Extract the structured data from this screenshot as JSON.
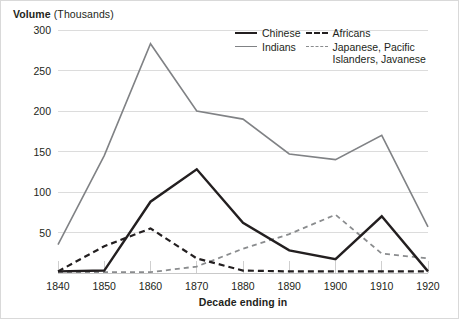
{
  "axis_title": {
    "strong": "Volume",
    "unit": " (Thousands)"
  },
  "xaxis_label": "Decade ending in",
  "legend": {
    "entries": [
      {
        "name": "chinese",
        "label": "Chinese",
        "color": "#231f20",
        "style": "solid",
        "width": 2.4
      },
      {
        "name": "africans",
        "label": "Africans",
        "color": "#231f20",
        "style": "dashed",
        "width": 2.2
      },
      {
        "name": "indians",
        "label": "Indians",
        "color": "#808285",
        "style": "solid",
        "width": 1.6
      },
      {
        "name": "japanese",
        "label": "Japanese, Pacific Islanders, Javanese",
        "color": "#8a8c8e",
        "style": "dashed",
        "width": 1.8
      }
    ]
  },
  "chart_data": {
    "type": "line",
    "title": "Volume (Thousands)",
    "xlabel": "Decade ending in",
    "ylabel": "Volume (Thousands)",
    "categories": [
      1840,
      1850,
      1860,
      1870,
      1880,
      1890,
      1900,
      1910,
      1920
    ],
    "xtick_labels": [
      "1840",
      "1850",
      "1860",
      "1870",
      "1880",
      "1890",
      "1900",
      "1910",
      "1920"
    ],
    "ytick_labels": [
      "50",
      "100",
      "150",
      "200",
      "250",
      "300"
    ],
    "yticks": [
      50,
      100,
      150,
      200,
      250,
      300
    ],
    "ylim": [
      0,
      300
    ],
    "xlim": [
      1840,
      1920
    ],
    "grid": "horizontal",
    "legend_position": "top-right",
    "series": [
      {
        "name": "Chinese",
        "color": "#231f20",
        "style": "solid",
        "width": 2.4,
        "values": [
          2,
          3,
          88,
          128,
          62,
          28,
          17,
          70,
          2
        ]
      },
      {
        "name": "Africans",
        "color": "#231f20",
        "style": "dashed",
        "width": 2.2,
        "values": [
          2,
          33,
          55,
          18,
          3,
          2,
          2,
          2,
          2
        ]
      },
      {
        "name": "Indians",
        "color": "#808285",
        "style": "solid",
        "width": 1.6,
        "values": [
          35,
          145,
          283,
          200,
          190,
          147,
          140,
          170,
          57
        ]
      },
      {
        "name": "Japanese, Pacific Islanders, Javanese",
        "color": "#8a8c8e",
        "style": "dashed",
        "width": 1.8,
        "values": [
          1,
          1,
          1,
          8,
          30,
          48,
          72,
          24,
          18
        ]
      }
    ]
  }
}
